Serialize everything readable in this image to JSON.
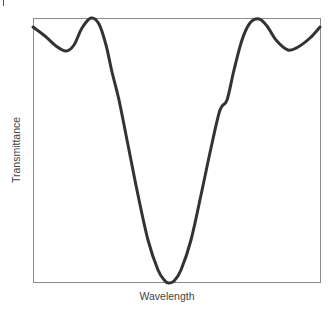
{
  "chart_data": {
    "type": "line",
    "title": "",
    "xlabel": "Wavelength",
    "ylabel": "Transmittance",
    "xticks": [],
    "yticks": [],
    "grid": false,
    "legend": null,
    "axis_box": {
      "left": 33,
      "right": 320,
      "top": 18,
      "bottom": 282
    },
    "series": [
      {
        "name": "transmittance",
        "color": "#333333",
        "points_px": [
          [
            33,
            27
          ],
          [
            45,
            36
          ],
          [
            56,
            46
          ],
          [
            66,
            51
          ],
          [
            74,
            45
          ],
          [
            82,
            28
          ],
          [
            91,
            18
          ],
          [
            99,
            24
          ],
          [
            106,
            45
          ],
          [
            112,
            72
          ],
          [
            119,
            100
          ],
          [
            128,
            145
          ],
          [
            138,
            195
          ],
          [
            148,
            240
          ],
          [
            158,
            270
          ],
          [
            165,
            281
          ],
          [
            169,
            283
          ],
          [
            174,
            281
          ],
          [
            181,
            270
          ],
          [
            191,
            240
          ],
          [
            201,
            195
          ],
          [
            211,
            148
          ],
          [
            220,
            110
          ],
          [
            227,
            100
          ],
          [
            234,
            70
          ],
          [
            242,
            40
          ],
          [
            250,
            23
          ],
          [
            259,
            19
          ],
          [
            267,
            26
          ],
          [
            276,
            40
          ],
          [
            288,
            50
          ],
          [
            298,
            47
          ],
          [
            310,
            38
          ],
          [
            320,
            27
          ]
        ]
      }
    ]
  },
  "labels": {
    "x": "Wavelength",
    "y": "Transmittance"
  }
}
